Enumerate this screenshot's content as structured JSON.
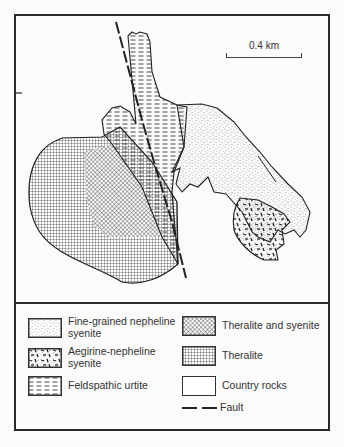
{
  "map": {
    "scale_label": "0.4 km",
    "units": [
      {
        "id": "fine-grained-nepheline-syenite",
        "pattern": "stipple"
      },
      {
        "id": "aegirine-nepheline-syenite",
        "pattern": "short-dashes"
      },
      {
        "id": "feldspathic-urtite",
        "pattern": "horizontal-dashes"
      },
      {
        "id": "theralite-and-syenite",
        "pattern": "diagonal-crosshatch"
      },
      {
        "id": "theralite",
        "pattern": "square-grid"
      },
      {
        "id": "country-rocks",
        "pattern": "blank"
      }
    ],
    "features": [
      "fault"
    ]
  },
  "legend": {
    "items": [
      {
        "label_line1": "Fine-grained nepheline",
        "label_line2": "syenite"
      },
      {
        "label_line1": "Aegirine-nepheline",
        "label_line2": "syenite"
      },
      {
        "label_line1": "Feldspathic urtite",
        "label_line2": ""
      },
      {
        "label_line1": "Theralite and syenite",
        "label_line2": ""
      },
      {
        "label_line1": "Theralite",
        "label_line2": ""
      },
      {
        "label_line1": "Country rocks",
        "label_line2": ""
      },
      {
        "label_line1": "Fault",
        "label_line2": ""
      }
    ]
  },
  "colors": {
    "ink": "#2a2a2a",
    "paper": "#fbfbfb"
  }
}
